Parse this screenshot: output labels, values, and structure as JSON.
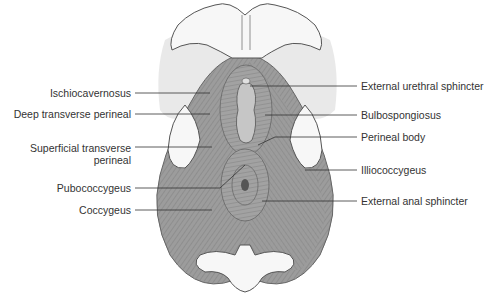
{
  "diagram": {
    "colors": {
      "muscle": "#9a9a9a",
      "muscle_dark": "#7d7d7d",
      "fiber": "#6e6e6e",
      "bone": "#f6f6f6",
      "soft_tissue": "#e8e8e8",
      "outline": "#555555",
      "leader": "#333333",
      "opening": "#c4c4c4"
    },
    "labels_left": [
      {
        "text": "Ischiocavernosus",
        "y": 87
      },
      {
        "text": "Deep transverse perineal",
        "y": 108
      },
      {
        "text": "Superficial transverse",
        "text2": "perineal",
        "y": 142
      },
      {
        "text": "Pubococcygeus",
        "y": 186
      },
      {
        "text": "Coccygeus",
        "y": 208
      }
    ],
    "labels_right": [
      {
        "text": "External urethral sphincter",
        "y": 86
      },
      {
        "text": "Bulbospongiosus",
        "y": 115
      },
      {
        "text": "Perineal body",
        "y": 137
      },
      {
        "text": "Illiococcygeus",
        "y": 170
      },
      {
        "text": "External anal sphincter",
        "y": 201
      }
    ]
  }
}
